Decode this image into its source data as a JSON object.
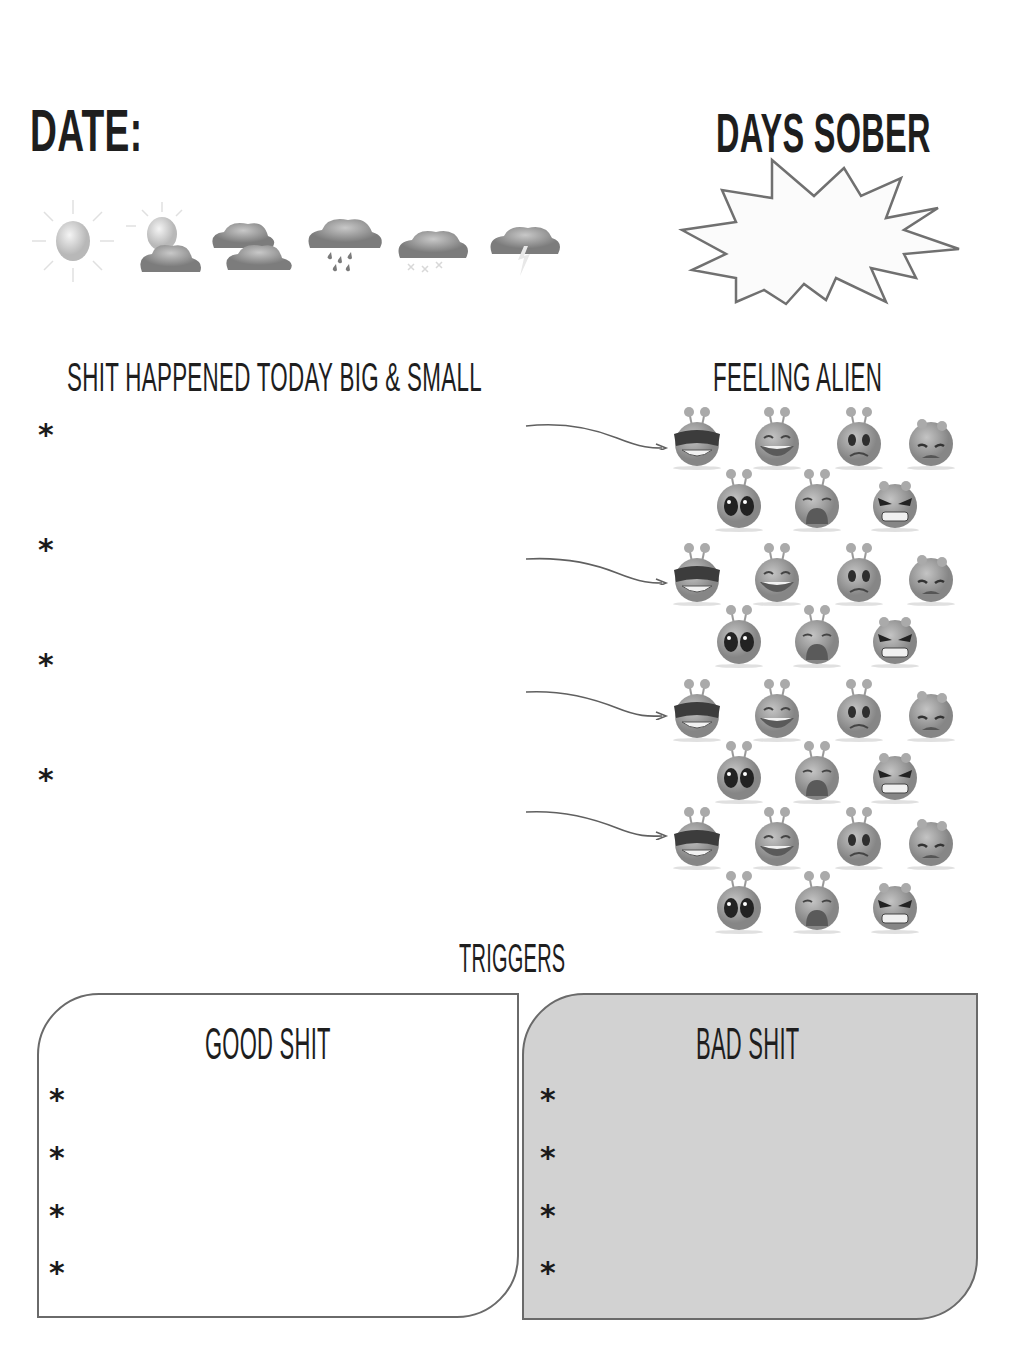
{
  "header": {
    "date_label": "DATE:",
    "days_sober_label": "DAYS SOBER"
  },
  "weather": [
    {
      "icon": "sun-icon",
      "label": "sunny"
    },
    {
      "icon": "sun-cloud-icon",
      "label": "partly cloudy"
    },
    {
      "icon": "clouds-icon",
      "label": "cloudy"
    },
    {
      "icon": "rain-cloud-icon",
      "label": "rain"
    },
    {
      "icon": "snow-cloud-icon",
      "label": "snow"
    },
    {
      "icon": "storm-cloud-icon",
      "label": "thunderstorm"
    }
  ],
  "happened": {
    "title": "SHIT HAPPENED TODAY BIG & SMALL",
    "bullet": "*",
    "items": [
      "",
      "",
      "",
      ""
    ]
  },
  "feelings": {
    "title": "FEELING ALIEN",
    "faces": [
      "cool",
      "laughing",
      "worried",
      "sad",
      "shocked",
      "crying",
      "angry"
    ],
    "rows": 4
  },
  "triggers": {
    "title": "TRIGGERS",
    "good": {
      "title": "GOOD SHIT",
      "bullet": "*",
      "items": [
        "",
        "",
        "",
        ""
      ]
    },
    "bad": {
      "title": "BAD SHIT",
      "bullet": "*",
      "items": [
        "",
        "",
        "",
        ""
      ]
    }
  },
  "colors": {
    "ink": "#1e1e1e",
    "outline": "#6a6a6a",
    "bad_box_fill": "#d2d2d2",
    "alien_body": "#9a9a9a"
  }
}
